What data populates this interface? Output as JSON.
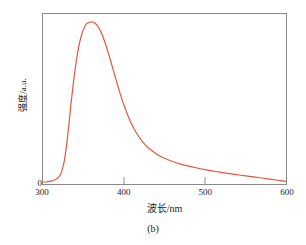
{
  "caption": "(b)",
  "axes": {
    "xlabel": "波长/nm",
    "ylabel": "强度/a.u.",
    "y_zero_label": "0",
    "xticks": [
      "300",
      "400",
      "500",
      "600"
    ]
  },
  "colors": {
    "curve": "#e8543f",
    "frame": "#8a8a8a",
    "text": "#1a1a1a",
    "background": "#ffffff"
  },
  "chart_data": {
    "type": "line",
    "title": "",
    "subtitle": "",
    "xlabel": "波长/nm",
    "ylabel": "强度/a.u.",
    "xlim": [
      300,
      600
    ],
    "ylim": [
      0,
      1.05
    ],
    "xticks": [
      300,
      400,
      500,
      600
    ],
    "yticks": [
      0
    ],
    "ytick_labels": [
      "0"
    ],
    "grid": false,
    "legend": null,
    "annotations": [],
    "peak": {
      "x": 362,
      "y": 1.0
    },
    "series": [
      {
        "name": "激发光谱",
        "color": "#e8543f",
        "x": [
          300,
          305,
          310,
          315,
          318,
          320,
          323,
          326,
          329,
          332,
          335,
          338,
          341,
          344,
          347,
          350,
          353,
          356,
          359,
          362,
          365,
          368,
          371,
          374,
          377,
          380,
          384,
          388,
          392,
          396,
          400,
          405,
          410,
          415,
          420,
          425,
          430,
          440,
          450,
          460,
          470,
          480,
          490,
          500,
          510,
          520,
          530,
          540,
          550,
          560,
          570,
          580,
          590,
          600
        ],
        "y": [
          0.012,
          0.014,
          0.018,
          0.026,
          0.035,
          0.046,
          0.075,
          0.135,
          0.235,
          0.37,
          0.515,
          0.645,
          0.755,
          0.845,
          0.91,
          0.955,
          0.985,
          0.998,
          1.0,
          1.0,
          0.99,
          0.972,
          0.945,
          0.91,
          0.868,
          0.82,
          0.752,
          0.682,
          0.612,
          0.546,
          0.486,
          0.42,
          0.364,
          0.318,
          0.28,
          0.249,
          0.224,
          0.186,
          0.159,
          0.139,
          0.123,
          0.11,
          0.099,
          0.089,
          0.08,
          0.072,
          0.064,
          0.057,
          0.05,
          0.044,
          0.037,
          0.03,
          0.023,
          0.016
        ]
      }
    ]
  }
}
